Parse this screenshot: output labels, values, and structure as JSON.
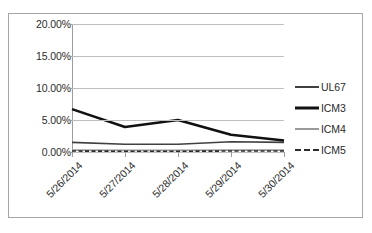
{
  "chart_data": {
    "type": "line",
    "title": "",
    "xlabel": "",
    "ylabel": "",
    "categories": [
      "5/26/2014",
      "5/27/2014",
      "5/28/2014",
      "5/29/2014",
      "5/30/2014"
    ],
    "ylim": [
      0,
      20
    ],
    "ytick_labels": [
      "20.00%",
      "15.00%",
      "10.00%",
      "5.00%",
      "0.00%"
    ],
    "ytick_values": [
      20,
      15,
      10,
      5,
      0
    ],
    "grid": true,
    "legend_position": "right",
    "series": [
      {
        "name": "UL67",
        "style": "solid",
        "color": "#404040",
        "width": 1.6,
        "values": [
          1.5,
          1.2,
          1.2,
          1.6,
          1.5
        ]
      },
      {
        "name": "ICM3",
        "style": "solid",
        "color": "#111111",
        "width": 2.6,
        "values": [
          6.7,
          3.9,
          5.0,
          2.7,
          1.8
        ]
      },
      {
        "name": "ICM4",
        "style": "solid",
        "color": "#9a9a9a",
        "width": 1.6,
        "values": [
          0.3,
          0.25,
          0.25,
          0.3,
          0.3
        ]
      },
      {
        "name": "ICM5",
        "style": "dashed",
        "color": "#2b2b2b",
        "width": 1.6,
        "values": [
          0.15,
          0.12,
          0.12,
          0.15,
          0.15
        ]
      }
    ]
  },
  "axes": {
    "y_ticks": [
      {
        "label": "20.00%",
        "value": 20
      },
      {
        "label": "15.00%",
        "value": 15
      },
      {
        "label": "10.00%",
        "value": 10
      },
      {
        "label": "5.00%",
        "value": 5
      },
      {
        "label": "0.00%",
        "value": 0
      }
    ],
    "x_ticks": [
      {
        "label": "5/26/2014"
      },
      {
        "label": "5/27/2014"
      },
      {
        "label": "5/28/2014"
      },
      {
        "label": "5/29/2014"
      },
      {
        "label": "5/30/2014"
      }
    ]
  },
  "legend": {
    "entries": [
      {
        "label": "UL67"
      },
      {
        "label": "ICM3"
      },
      {
        "label": "ICM4"
      },
      {
        "label": "ICM5"
      }
    ]
  }
}
